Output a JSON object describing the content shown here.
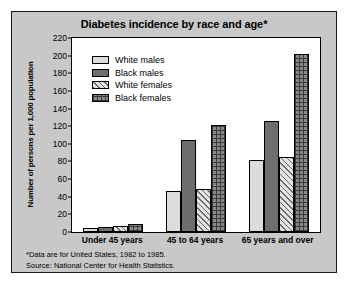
{
  "chart_data": {
    "type": "bar",
    "title": "Diabetes incidence by race and age*",
    "xlabel": "",
    "ylabel": "Number of persons per 1,000 population",
    "categories": [
      "Under 45 years",
      "45 to 64 years",
      "65 years and over"
    ],
    "series": [
      {
        "name": "White males",
        "values": [
          5,
          47,
          82
        ]
      },
      {
        "name": "Black males",
        "values": [
          6,
          104,
          126
        ]
      },
      {
        "name": "White females",
        "values": [
          7,
          49,
          85
        ]
      },
      {
        "name": "Black females",
        "values": [
          9,
          121,
          202
        ]
      }
    ],
    "ylim": [
      0,
      220
    ],
    "yticks": [
      0,
      20,
      40,
      60,
      80,
      100,
      120,
      140,
      160,
      180,
      200,
      220
    ],
    "grid": false,
    "legend_position": "upper-left",
    "annotations": [
      "*Data are for United States, 1982 to 1985.",
      "Source: National Center for Health Statistics."
    ]
  },
  "colors": {
    "figure_background": "#c8c8c8",
    "plot_background": "#ffffff",
    "axis": "#000000",
    "white_males": "#dcdcdc",
    "black_males": "#6e6e6e",
    "white_females": "#e4e4e4",
    "black_females": "#8a8a8a"
  },
  "notes": {
    "line1": "*Data are for United States, 1982 to 1985.",
    "line2": "Source: National Center for Health Statistics."
  }
}
